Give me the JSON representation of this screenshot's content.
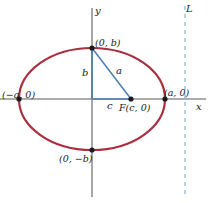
{
  "figure": {
    "kind": "ellipse-geometry-diagram",
    "background_color": "#ffffff"
  },
  "axes": {
    "x_label": "x",
    "y_label": "y",
    "color": "#8f9194",
    "origin": {
      "x": 92,
      "y": 99
    }
  },
  "ellipse": {
    "color": "#a8303f",
    "stroke_width": 2.2,
    "center": {
      "x": 92,
      "y": 99
    },
    "semi_major_px": 73,
    "semi_minor_px": 51
  },
  "triangle": {
    "color": "#4a7fb5",
    "leg_vertical_label": "b",
    "leg_horizontal_label": "c",
    "hypotenuse_label": "a"
  },
  "points": [
    {
      "id": "vertex-left",
      "label": "(−a, 0)",
      "x": 19,
      "y": 99,
      "label_x": 2,
      "label_y": 90
    },
    {
      "id": "vertex-right",
      "label": "(a, 0)",
      "x": 165,
      "y": 99,
      "label_x": 164,
      "label_y": 88
    },
    {
      "id": "covertex-top",
      "label": "(0, b)",
      "x": 92,
      "y": 48,
      "label_x": 95,
      "label_y": 38
    },
    {
      "id": "covertex-bottom",
      "label": "(0, −b)",
      "x": 92,
      "y": 150,
      "label_x": 59,
      "label_y": 154
    },
    {
      "id": "focus",
      "label": "F(c, 0)",
      "x": 131,
      "y": 99,
      "label_x": 119,
      "label_y": 103
    }
  ],
  "directrix": {
    "label": "L",
    "color": "#9ec4e0",
    "x": 185,
    "dash": "4 4",
    "label_x": 186,
    "label_y": 4
  },
  "side_labels": {
    "b": {
      "text": "b",
      "x": 82,
      "y": 68
    },
    "a": {
      "text": "a",
      "x": 116,
      "y": 66
    },
    "c": {
      "text": "c",
      "x": 107,
      "y": 101
    }
  }
}
